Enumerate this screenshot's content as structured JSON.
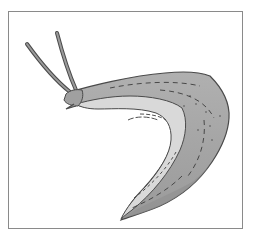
{
  "figure": {
    "subject": "slug",
    "alt": "Line illustration of a slug with two eye tentacles, curved body",
    "colors": {
      "frame": "#8a8a8a",
      "background": "#ffffff",
      "body": "#a6a6a6",
      "body_shadow": "#8f8f8f",
      "foot": "#d9d9d9",
      "outline": "#4a4a4a",
      "markings": "#3c3c3c"
    }
  }
}
